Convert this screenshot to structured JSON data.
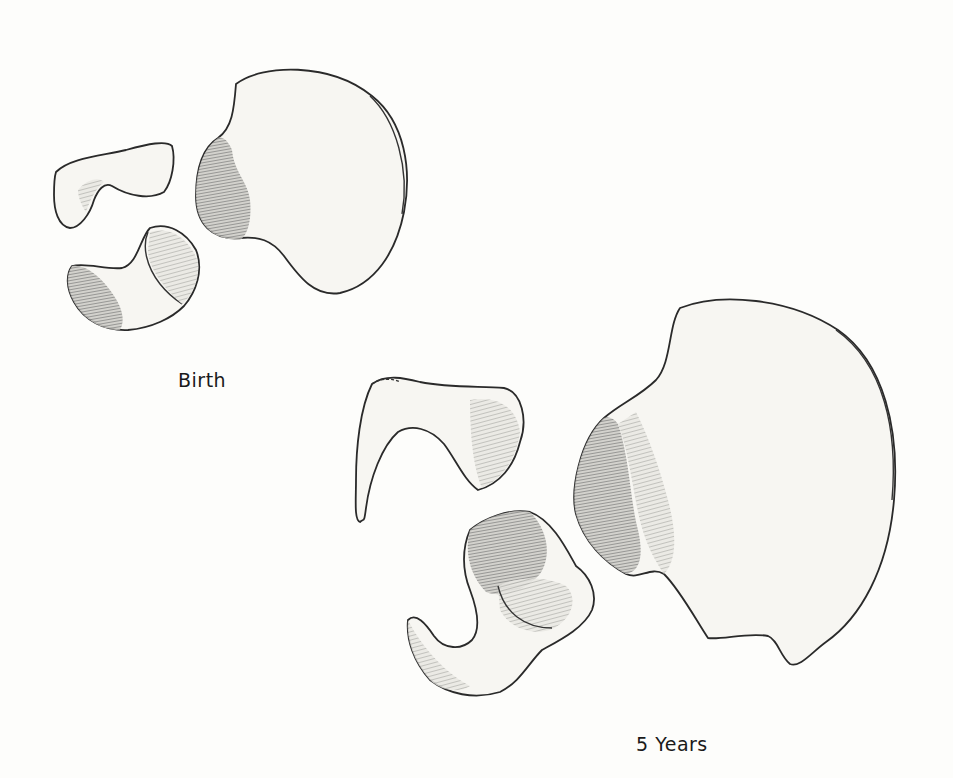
{
  "figure": {
    "stages": [
      {
        "label": "Birth",
        "bones": [
          "ilium",
          "ischium",
          "pubis"
        ]
      },
      {
        "label": "5 Years",
        "bones": [
          "ilium",
          "ischium",
          "pubis"
        ]
      }
    ],
    "colors": {
      "background": "#fdfdfb",
      "outline": "#2a2a2a",
      "bone_fill": "#f7f6f2"
    }
  }
}
